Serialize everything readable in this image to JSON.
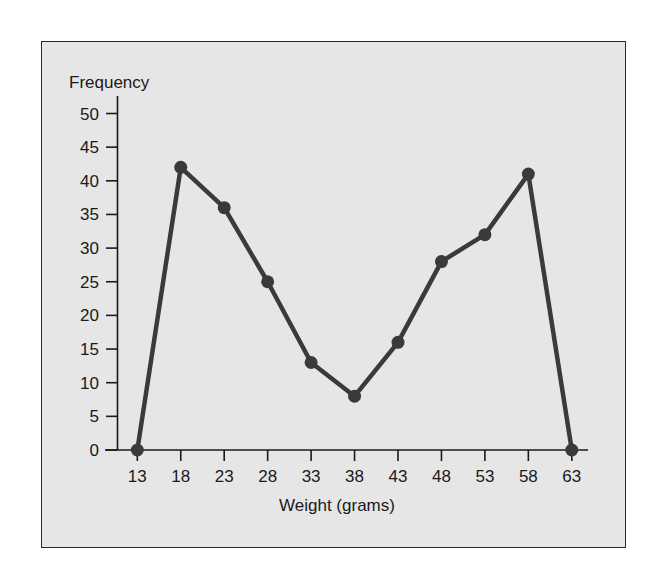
{
  "chart_data": {
    "type": "line",
    "title": "",
    "xlabel": "Weight (grams)",
    "ylabel": "Frequency",
    "x": [
      13,
      18,
      23,
      28,
      33,
      38,
      43,
      48,
      53,
      58,
      63
    ],
    "categories": [
      "13",
      "18",
      "23",
      "28",
      "33",
      "38",
      "43",
      "48",
      "53",
      "58",
      "63"
    ],
    "series": [
      {
        "name": "Frequency",
        "values": [
          0,
          42,
          36,
          25,
          13,
          8,
          16,
          28,
          32,
          41,
          0
        ]
      }
    ],
    "ylim": [
      0,
      50
    ],
    "yticks": [
      0,
      5,
      10,
      15,
      20,
      25,
      30,
      35,
      40,
      45,
      50
    ],
    "xticks": [
      13,
      18,
      23,
      28,
      33,
      38,
      43,
      48,
      53,
      58,
      63
    ],
    "grid": false,
    "legend": null,
    "markers": true
  },
  "colors": {
    "line": "#3a3a3a",
    "marker": "#3a3a3a",
    "plot_background": "#e6e6e6",
    "page_background": "#ffffff",
    "axis": "#1a1a1a"
  }
}
